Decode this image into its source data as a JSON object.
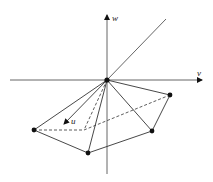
{
  "diagram": {
    "type": "3d-coordinate-polyhedron",
    "colors": {
      "line": "#333333",
      "vertex": "#111111",
      "background": "#ffffff"
    },
    "axes": {
      "v": {
        "label": "v",
        "from": [
          10,
          80
        ],
        "to": [
          203,
          80
        ]
      },
      "w": {
        "label": "w",
        "from": [
          107,
          174
        ],
        "to": [
          107,
          15
        ]
      },
      "u": {
        "label": "u",
        "from": [
          107,
          80
        ],
        "to": [
          63,
          125
        ]
      },
      "diagonal": {
        "from": [
          107,
          80
        ],
        "to": [
          166,
          19
        ]
      }
    },
    "origin": [
      107,
      80
    ],
    "vertices": [
      {
        "id": "left",
        "pos": [
          34,
          130
        ]
      },
      {
        "id": "bottom",
        "pos": [
          88,
          153
        ]
      },
      {
        "id": "lower-right",
        "pos": [
          152,
          131
        ]
      },
      {
        "id": "right",
        "pos": [
          170,
          95
        ]
      },
      {
        "id": "hidden",
        "pos": [
          84,
          130
        ]
      }
    ],
    "labels": {
      "v": "v",
      "w": "w",
      "u": "u"
    }
  }
}
